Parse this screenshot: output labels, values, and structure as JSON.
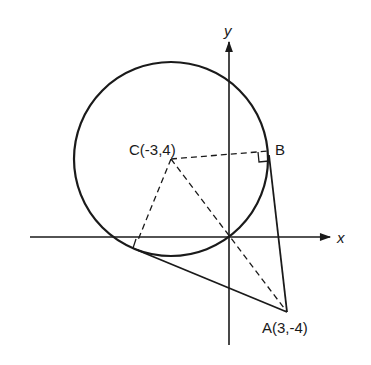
{
  "diagram": {
    "type": "geometry",
    "axes": {
      "x_label": "x",
      "y_label": "y"
    },
    "circle": {
      "center_label": "C(-3,4)",
      "center": [
        -3,
        4
      ],
      "radius": 5
    },
    "points": {
      "C": {
        "label": "C(-3,4)",
        "coords": [
          -3,
          4
        ]
      },
      "A": {
        "label": "A(3,-4)",
        "coords": [
          3,
          -4
        ]
      },
      "B": {
        "label": "B"
      }
    },
    "lines": [
      {
        "from": "A",
        "to": "B",
        "style": "solid",
        "kind": "tangent"
      },
      {
        "from": "A",
        "to": "T2",
        "style": "solid",
        "kind": "tangent"
      },
      {
        "from": "C",
        "to": "B",
        "style": "dashed",
        "kind": "radius"
      },
      {
        "from": "C",
        "to": "T2",
        "style": "dashed",
        "kind": "radius"
      },
      {
        "from": "C",
        "to": "A",
        "style": "dashed",
        "kind": "line through origin"
      }
    ],
    "right_angle_marks": [
      "B",
      "T2"
    ],
    "colors": {
      "ink": "#1a1a1a",
      "background": "#ffffff"
    }
  }
}
